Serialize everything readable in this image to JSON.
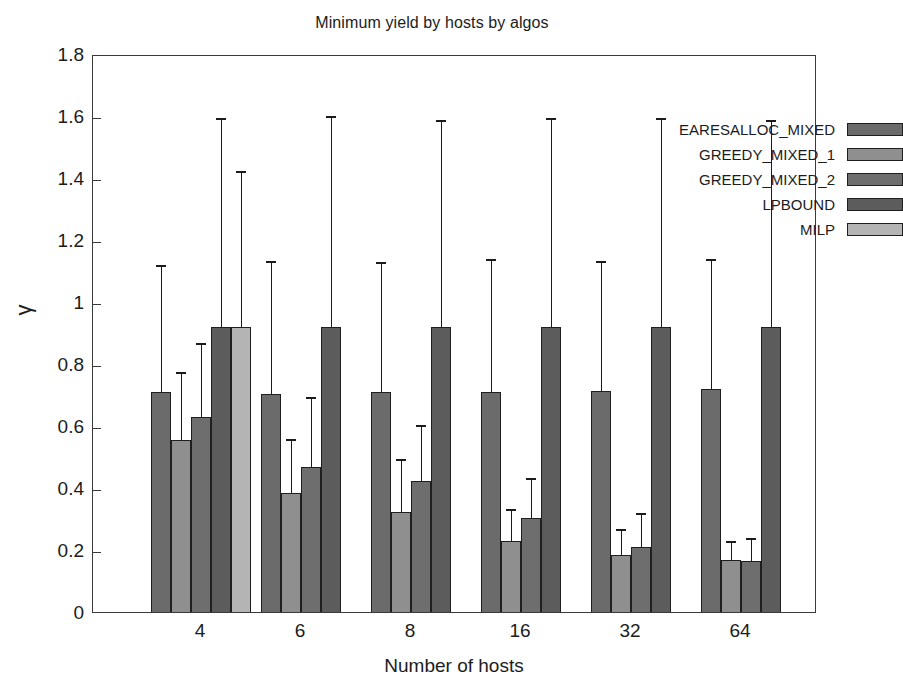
{
  "chart_data": {
    "type": "bar",
    "title": "Minimum yield by hosts by algos",
    "xlabel": "Number of hosts",
    "ylabel": "γ",
    "categories": [
      "4",
      "6",
      "8",
      "16",
      "32",
      "64"
    ],
    "ylim": [
      0,
      1.8
    ],
    "ytick_labels": [
      "0",
      "0.2",
      "0.4",
      "0.6",
      "0.8",
      "1",
      "1.2",
      "1.4",
      "1.6",
      "1.8"
    ],
    "ytick_values": [
      0,
      0.2,
      0.4,
      0.6,
      0.8,
      1.0,
      1.2,
      1.4,
      1.6,
      1.8
    ],
    "grid": false,
    "legend_position": "top-right",
    "errorbars": true,
    "series": [
      {
        "name": "EARESALLOC_MIXED",
        "color": "#6b6b6b",
        "values": [
          0.715,
          0.71,
          0.715,
          0.715,
          0.72,
          0.725
        ],
        "error_high": [
          1.125,
          1.14,
          1.135,
          1.145,
          1.14,
          1.145
        ]
      },
      {
        "name": "GREEDY_MIXED_1",
        "color": "#8f8f8f",
        "values": [
          0.56,
          0.39,
          0.33,
          0.235,
          0.19,
          0.175
        ],
        "error_high": [
          0.78,
          0.565,
          0.5,
          0.34,
          0.275,
          0.235
        ]
      },
      {
        "name": "GREEDY_MIXED_2",
        "color": "#6e6e6e",
        "values": [
          0.635,
          0.475,
          0.43,
          0.31,
          0.215,
          0.17
        ],
        "error_high": [
          0.875,
          0.7,
          0.61,
          0.44,
          0.325,
          0.245
        ]
      },
      {
        "name": "LPBOUND",
        "color": "#5c5c5c",
        "values": [
          0.925,
          0.925,
          0.925,
          0.925,
          0.925,
          0.925
        ],
        "error_high": [
          1.6,
          1.605,
          1.595,
          1.6,
          1.6,
          1.595
        ]
      },
      {
        "name": "MILP",
        "color": "#b4b4b4",
        "values": [
          0.925,
          null,
          null,
          null,
          null,
          null
        ],
        "error_high": [
          1.43,
          null,
          null,
          null,
          null,
          null
        ]
      }
    ]
  }
}
